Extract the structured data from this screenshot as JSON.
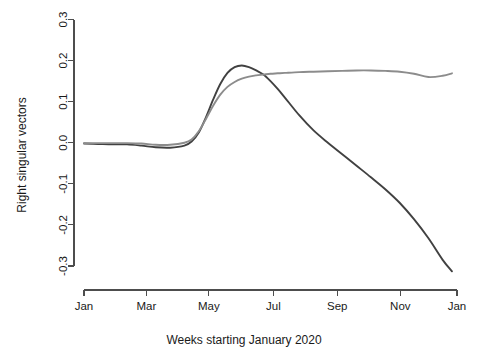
{
  "chart_data": {
    "type": "line",
    "title": "",
    "xlabel": "Weeks starting January 2020",
    "ylabel": "Right singular vectors",
    "grid": false,
    "legend": "none",
    "ylim": [
      -0.33,
      0.3
    ],
    "xlim": [
      0,
      52
    ],
    "yticks": [
      "0.3",
      "0.2",
      "0.1",
      "0.0",
      "-0.1",
      "-0.2",
      "-0.3"
    ],
    "ytick_values": [
      0.3,
      0.2,
      0.1,
      0.0,
      -0.1,
      -0.2,
      -0.3
    ],
    "xticks": [
      "Jan",
      "Mar",
      "May",
      "Jul",
      "Sep",
      "Nov",
      "Jan"
    ],
    "xtick_values": [
      0,
      8.7,
      17.4,
      26.4,
      35.3,
      44.1,
      52
    ],
    "x": [
      0,
      2,
      4,
      6,
      8,
      10,
      12,
      14,
      15,
      16,
      17,
      18,
      19,
      20,
      21,
      22,
      23,
      24,
      25,
      26,
      27,
      28,
      30,
      32,
      34,
      36,
      38,
      40,
      42,
      44,
      46,
      48,
      50,
      51.3
    ],
    "series": [
      {
        "name": "first-right-singular-vector",
        "color": "#414141",
        "width": 1.9,
        "values": [
          -0.002,
          -0.003,
          -0.004,
          -0.004,
          -0.007,
          -0.011,
          -0.012,
          -0.007,
          0.003,
          0.025,
          0.062,
          0.105,
          0.143,
          0.17,
          0.184,
          0.188,
          0.184,
          0.176,
          0.166,
          0.15,
          0.131,
          0.11,
          0.067,
          0.03,
          0.0,
          -0.028,
          -0.056,
          -0.084,
          -0.113,
          -0.146,
          -0.186,
          -0.232,
          -0.285,
          -0.313
        ]
      },
      {
        "name": "second-right-singular-vector",
        "color": "#8c8c8c",
        "width": 1.9,
        "values": [
          -0.001,
          -0.001,
          -0.001,
          -0.001,
          -0.002,
          -0.005,
          -0.005,
          0.0,
          0.008,
          0.028,
          0.058,
          0.09,
          0.117,
          0.136,
          0.148,
          0.156,
          0.161,
          0.164,
          0.166,
          0.168,
          0.169,
          0.17,
          0.172,
          0.173,
          0.174,
          0.175,
          0.176,
          0.176,
          0.175,
          0.173,
          0.168,
          0.16,
          0.163,
          0.169
        ]
      }
    ]
  },
  "axes": {
    "y_axis_name": "y-axis",
    "x_axis_name": "x-axis"
  }
}
